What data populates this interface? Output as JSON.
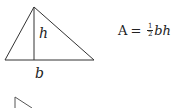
{
  "diagram": {
    "triangle": {
      "apex": [
        34,
        7
      ],
      "base_left": [
        5,
        60
      ],
      "base_right": [
        94,
        60
      ],
      "height_foot": [
        34,
        60
      ],
      "height_label": "h",
      "base_label": "b"
    },
    "formula": {
      "lhs": "A",
      "equals": "=",
      "frac_numerator": "1",
      "frac_denominator": "2",
      "rhs_vars": "bh"
    },
    "partial_figure": {
      "vertical_line": [
        [
          15,
          97
        ],
        [
          15,
          108
        ]
      ],
      "diagonal_line": [
        [
          15,
          97
        ],
        [
          32,
          108
        ]
      ]
    },
    "colors": {
      "stroke": "#333333",
      "background": "#ffffff"
    }
  }
}
